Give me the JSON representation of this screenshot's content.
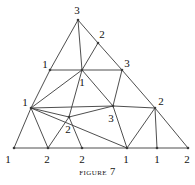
{
  "figure": {
    "caption_word": "Figure",
    "caption_number": "7",
    "stroke_color": "#3a3a3a",
    "label_color": "#111111",
    "background_color": "#ffffff"
  },
  "graph": {
    "vertices": [
      {
        "id": "apex",
        "x": 78,
        "y": 20,
        "label": "3",
        "lx": 77,
        "ly": 10
      },
      {
        "id": "r-upper",
        "x": 98,
        "y": 43,
        "label": "2",
        "lx": 102,
        "ly": 34
      },
      {
        "id": "l-upper",
        "x": 50,
        "y": 70,
        "label": "1",
        "lx": 45,
        "ly": 64
      },
      {
        "id": "hub",
        "x": 82,
        "y": 70,
        "label": "1",
        "lx": 82,
        "ly": 82
      },
      {
        "id": "r-mid-upper",
        "x": 122,
        "y": 70,
        "label": "3",
        "lx": 127,
        "ly": 63
      },
      {
        "id": "l-mid",
        "x": 31,
        "y": 108,
        "label": "1",
        "lx": 25,
        "ly": 102
      },
      {
        "id": "c-mid",
        "x": 113,
        "y": 106,
        "label": "3",
        "lx": 111,
        "ly": 118
      },
      {
        "id": "r-mid",
        "x": 155,
        "y": 108,
        "label": "2",
        "lx": 161,
        "ly": 101
      },
      {
        "id": "l-low",
        "x": 69,
        "y": 117,
        "label": "2",
        "lx": 68,
        "ly": 129
      },
      {
        "id": "b-left",
        "x": 14,
        "y": 148,
        "label": "1",
        "lx": 8,
        "ly": 159
      },
      {
        "id": "b-two-a",
        "x": 48,
        "y": 148,
        "label": "2",
        "lx": 47,
        "ly": 159
      },
      {
        "id": "b-two-b",
        "x": 82,
        "y": 148,
        "label": "2",
        "lx": 82,
        "ly": 159
      },
      {
        "id": "b-one-a",
        "x": 127,
        "y": 148,
        "label": "1",
        "lx": 126,
        "ly": 159
      },
      {
        "id": "b-one-b",
        "x": 157,
        "y": 148,
        "label": "1",
        "lx": 157,
        "ly": 159
      },
      {
        "id": "b-right",
        "x": 188,
        "y": 148,
        "label": "2",
        "lx": 187,
        "ly": 159
      }
    ],
    "edges": [
      [
        "apex",
        "l-upper"
      ],
      [
        "l-upper",
        "l-mid"
      ],
      [
        "l-mid",
        "b-left"
      ],
      [
        "apex",
        "r-upper"
      ],
      [
        "r-upper",
        "r-mid-upper"
      ],
      [
        "r-mid-upper",
        "r-mid"
      ],
      [
        "r-mid",
        "b-right"
      ],
      [
        "b-left",
        "b-two-a"
      ],
      [
        "b-two-a",
        "b-two-b"
      ],
      [
        "b-two-b",
        "b-one-a"
      ],
      [
        "b-one-a",
        "b-one-b"
      ],
      [
        "b-one-b",
        "b-right"
      ],
      [
        "apex",
        "hub"
      ],
      [
        "l-upper",
        "hub"
      ],
      [
        "r-upper",
        "hub"
      ],
      [
        "hub",
        "r-mid-upper"
      ],
      [
        "hub",
        "l-mid"
      ],
      [
        "hub",
        "l-low"
      ],
      [
        "hub",
        "c-mid"
      ],
      [
        "r-mid-upper",
        "c-mid"
      ],
      [
        "l-mid",
        "l-low"
      ],
      [
        "l-mid",
        "b-two-a"
      ],
      [
        "l-mid",
        "c-mid"
      ],
      [
        "l-low",
        "b-two-a"
      ],
      [
        "l-low",
        "b-two-b"
      ],
      [
        "l-low",
        "c-mid"
      ],
      [
        "c-mid",
        "r-mid"
      ],
      [
        "c-mid",
        "b-one-a"
      ],
      [
        "r-mid",
        "b-one-a"
      ],
      [
        "r-mid",
        "b-one-b"
      ],
      [
        "l-mid",
        "b-one-a"
      ]
    ]
  }
}
